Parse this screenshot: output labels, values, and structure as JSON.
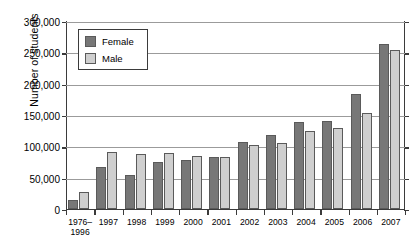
{
  "chart_data": {
    "type": "bar",
    "title": "",
    "xlabel": "",
    "ylabel": "Number of students",
    "ylim": [
      0,
      300000
    ],
    "yticks": [
      0,
      50000,
      100000,
      150000,
      200000,
      250000,
      300000
    ],
    "ytick_labels": [
      "0",
      "50,000",
      "100,000",
      "150,000",
      "200,000",
      "250,000",
      "300,000"
    ],
    "grid": true,
    "legend_position": "upper left inside plot",
    "categories": [
      "1976–\n1996",
      "1997",
      "1998",
      "1999",
      "2000",
      "2001",
      "2002",
      "2003",
      "2004",
      "2005",
      "2006",
      "2007"
    ],
    "series": [
      {
        "name": "Female",
        "color": "#777777",
        "values": [
          14000,
          66000,
          54000,
          75000,
          78000,
          83000,
          106000,
          117000,
          139000,
          140000,
          183000,
          263000
        ]
      },
      {
        "name": "Male",
        "color": "#cfcfcf",
        "values": [
          27000,
          90000,
          87000,
          89000,
          84000,
          83000,
          101000,
          105000,
          124000,
          128000,
          153000,
          253000
        ]
      }
    ]
  },
  "legend": {
    "items": [
      {
        "label": "Female",
        "swatch": "female-swatch"
      },
      {
        "label": "Male",
        "swatch": "male-swatch"
      }
    ]
  },
  "axis": {
    "y_title": "Number of students"
  }
}
